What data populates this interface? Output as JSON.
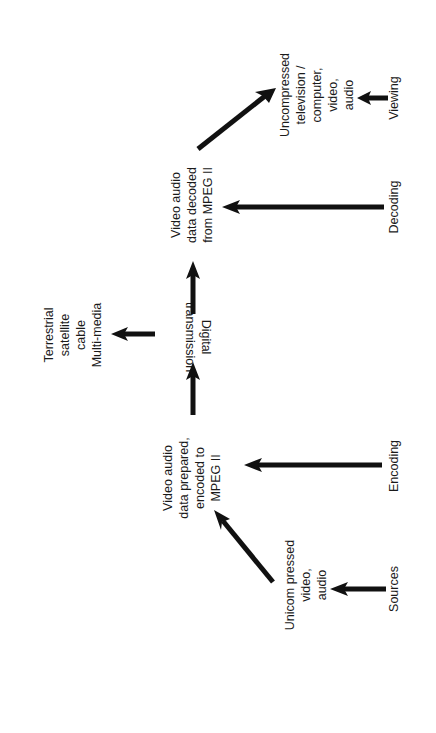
{
  "diagram": {
    "orientation": "rotated 90 degrees counter-clockwise (flow reads bottom to top)",
    "stages": {
      "sources": "Sources",
      "encoding": "Encoding",
      "decoding": "Decoding",
      "viewing": "Viewing"
    },
    "nodes": {
      "uncompressed_source": {
        "lines": [
          "Unicom pressed",
          "video,",
          "audio"
        ]
      },
      "encoded": {
        "lines": [
          "Video  audio",
          "data prepared,",
          "encoded to",
          "MPEG II"
        ]
      },
      "transmission": {
        "lines": [
          "Digital",
          "transmission"
        ]
      },
      "media": {
        "lines": [
          "Terrestrial",
          "satellite",
          "cable",
          "Multi-media"
        ]
      },
      "decoded": {
        "lines": [
          "Video  audio",
          "data decoded",
          "from MPEG II"
        ]
      },
      "output": {
        "lines": [
          "Uncompressed",
          "television /",
          "computer,",
          "video,",
          "audio"
        ]
      }
    },
    "edges": [
      {
        "from": "Sources",
        "to": "uncompressed_source"
      },
      {
        "from": "uncompressed_source",
        "to": "encoded"
      },
      {
        "from": "Encoding",
        "to": "encoded"
      },
      {
        "from": "encoded",
        "to": "transmission"
      },
      {
        "from": "transmission",
        "to": "media"
      },
      {
        "from": "transmission",
        "to": "decoded"
      },
      {
        "from": "Decoding",
        "to": "decoded"
      },
      {
        "from": "decoded",
        "to": "output"
      },
      {
        "from": "Viewing",
        "to": "output"
      }
    ],
    "colors": {
      "ink": "#111111",
      "background": "#ffffff"
    }
  }
}
